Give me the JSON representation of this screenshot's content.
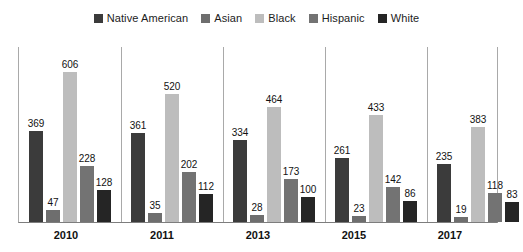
{
  "chart_data": {
    "type": "bar",
    "title": "",
    "subtitle": "",
    "xlabel": "",
    "ylabel": "",
    "categories": [
      "2010",
      "2011",
      "2013",
      "2015",
      "2017"
    ],
    "ylim": [
      0,
      606
    ],
    "grid": false,
    "legend_position": "top-center",
    "axis_max_for_scale": 660,
    "series": [
      {
        "name": "Native American",
        "color": "#3b3b3b",
        "values": [
          369,
          361,
          334,
          261,
          235
        ]
      },
      {
        "name": "Asian",
        "color": "#6e6e6e",
        "values": [
          47,
          35,
          28,
          23,
          19
        ]
      },
      {
        "name": "Black",
        "color": "#bdbdbd",
        "values": [
          606,
          520,
          464,
          433,
          383
        ]
      },
      {
        "name": "Hispanic",
        "color": "#737373",
        "values": [
          228,
          202,
          173,
          142,
          118
        ]
      },
      {
        "name": "White",
        "color": "#252525",
        "values": [
          128,
          112,
          100,
          86,
          83
        ]
      }
    ]
  },
  "legend": {
    "items": [
      {
        "label": "Native American",
        "color": "#3b3b3b"
      },
      {
        "label": "Asian",
        "color": "#6e6e6e"
      },
      {
        "label": "Black",
        "color": "#bdbdbd"
      },
      {
        "label": "Hispanic",
        "color": "#737373"
      },
      {
        "label": "White",
        "color": "#252525"
      }
    ]
  },
  "axis": {
    "x_tick_labels": [
      "2010",
      "2011",
      "2013",
      "2015",
      "2017"
    ]
  }
}
